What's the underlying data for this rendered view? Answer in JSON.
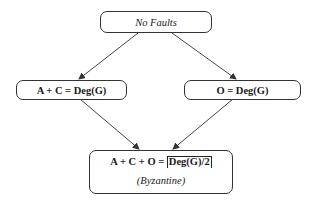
{
  "diagram": {
    "nodes": [
      {
        "id": "no-faults",
        "label": "No Faults",
        "style": "italic"
      },
      {
        "id": "ac-deg",
        "label": "A + C = Deg(G)",
        "style": "bold"
      },
      {
        "id": "o-deg",
        "label": "O = Deg(G)",
        "style": "bold"
      },
      {
        "id": "byzantine",
        "label_prefix": "A + C + O = ",
        "label_ceil": "Deg(G)/2",
        "sublabel": "(Byzantine)",
        "style": "bold"
      }
    ],
    "edges": [
      {
        "from": "no-faults",
        "to": "ac-deg"
      },
      {
        "from": "no-faults",
        "to": "o-deg"
      },
      {
        "from": "ac-deg",
        "to": "byzantine"
      },
      {
        "from": "o-deg",
        "to": "byzantine"
      }
    ],
    "colors": {
      "stroke": "#333333",
      "background": "#ffffff"
    }
  }
}
